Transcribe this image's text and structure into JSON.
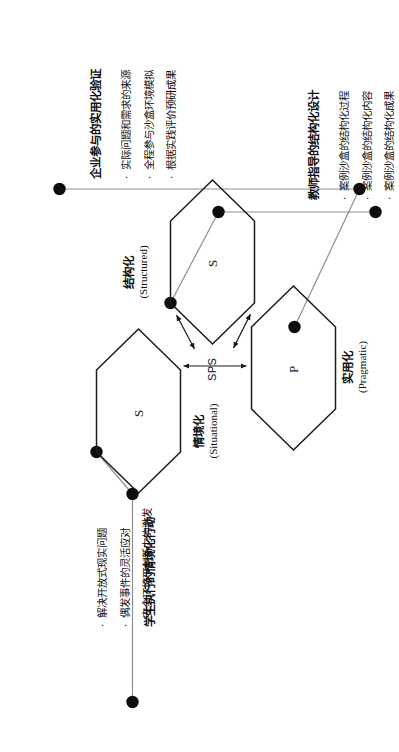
{
  "figure": {
    "type": "diagram",
    "center_label": "SPS",
    "orientation": "rotated-90-ccw"
  },
  "nodes": [
    {
      "id": "situational",
      "glyph": "S",
      "name_zh": "情境化",
      "name_en": "(Situational)"
    },
    {
      "id": "structured",
      "glyph": "S",
      "name_zh": "结构化",
      "name_en": "(Structured)"
    },
    {
      "id": "pragmatic",
      "glyph": "P",
      "name_zh": "实用化",
      "name_en": "(Pragmatic)"
    }
  ],
  "callouts": [
    {
      "id": "situational-callout",
      "headline": "学生执行的情境化行动",
      "bullets": [
        "解决开放式现实问题",
        "偶发事件的灵活应对",
        "安全环境下创新力的激发"
      ]
    },
    {
      "id": "structured-callout",
      "headline": "教师指导的结构化设计",
      "bullets": [
        "案例沙盒的结构化过程",
        "案例沙盒的结构化内容",
        "案例沙盒的结构化成果"
      ]
    },
    {
      "id": "pragmatic-callout",
      "headline": "企业参与的实用化验证",
      "bullets": [
        "实际问题和需求的来源",
        "全程参与沙盒环境模拟",
        "根据实践评价预研成果"
      ]
    }
  ],
  "bullet_marker": "·",
  "colors": {
    "stroke": "#1a1a1a",
    "leader_line": "#8a8a8a",
    "node_dot": "#0d0d0d",
    "background": "#ffffff",
    "text": "#111111"
  }
}
